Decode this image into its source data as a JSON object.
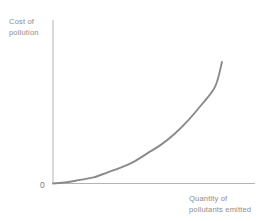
{
  "chart_data": {
    "type": "line",
    "title": "",
    "subtitle": "",
    "xlabel": "Quantity of pollutants emitted",
    "ylabel": "Cost of pollution",
    "xlabel_lines": [
      "Quantity of",
      "pollutants emitted"
    ],
    "ylabel_lines": [
      "Cost of",
      "pollution"
    ],
    "origin_label": "0",
    "grid": false,
    "legend": "none",
    "axis_ticks": {
      "x": [],
      "y": []
    },
    "xlim": [
      0,
      1
    ],
    "ylim": [
      0,
      1
    ],
    "series": [
      {
        "name": "Cost of pollution curve",
        "shape": "convex-increasing",
        "x": [
          0.0,
          0.08,
          0.16,
          0.24,
          0.32,
          0.4,
          0.48,
          0.56,
          0.64,
          0.72,
          0.8,
          0.88,
          0.96,
          1.0
        ],
        "y": [
          0.0,
          0.01,
          0.03,
          0.05,
          0.09,
          0.13,
          0.18,
          0.25,
          0.32,
          0.41,
          0.52,
          0.65,
          0.8,
          1.0
        ],
        "color": "#8a8a8a",
        "width": 1.9
      }
    ]
  },
  "style": {
    "background": "#ffffff",
    "axis_color": "#b4b4b4",
    "label_color": "#8d8d8d",
    "curve_color": "#8a8a8a"
  },
  "geometry": {
    "origin": {
      "x": 53,
      "y": 183.5
    },
    "y_axis_top": 20,
    "x_axis_right": 255,
    "curve_end": {
      "x": 222,
      "y": 62
    }
  }
}
